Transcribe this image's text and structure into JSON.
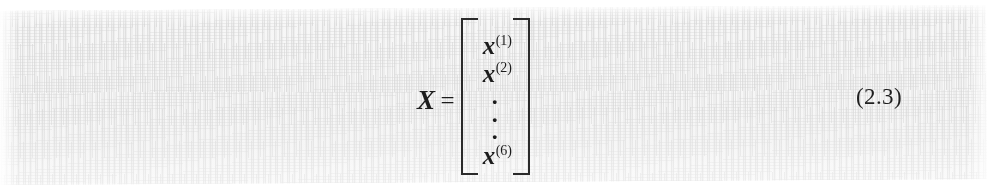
{
  "page": {
    "kind": "scanned-textbook-equation-fragment",
    "background_color": "#f6f6f6",
    "paper_color": "#ffffff",
    "ink_color": "#1c1c1c"
  },
  "equation": {
    "matrix_name": "X",
    "equals_sign": "=",
    "bracket_style": "square",
    "entries": [
      {
        "base": "x",
        "superscript": "(1)"
      },
      {
        "base": "x",
        "superscript": "(2)"
      },
      {
        "base": "⋮",
        "superscript": ""
      },
      {
        "base": "x",
        "superscript": "(6)"
      }
    ],
    "vertical_dots": "⋮",
    "number": "(2.3)"
  }
}
